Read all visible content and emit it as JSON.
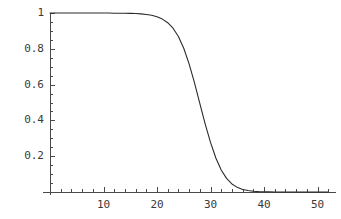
{
  "chart_data": {
    "type": "line",
    "title": "",
    "subtitle": "",
    "xlabel": "",
    "ylabel": "",
    "xlim": [
      0,
      52
    ],
    "ylim": [
      0,
      1.02
    ],
    "grid": false,
    "legend": null,
    "axis_color": "#4a4a4a",
    "line_color": "#2b2b2b",
    "background": "#ffffff",
    "x_ticks": [
      {
        "value": 10,
        "label": "10"
      },
      {
        "value": 20,
        "label": "20"
      },
      {
        "value": 30,
        "label": "30"
      },
      {
        "value": 40,
        "label": "40"
      },
      {
        "value": 50,
        "label": "50"
      }
    ],
    "y_ticks": [
      {
        "value": 0.2,
        "label": "0.2"
      },
      {
        "value": 0.4,
        "label": "0.4"
      },
      {
        "value": 0.6,
        "label": "0.6"
      },
      {
        "value": 0.8,
        "label": "0.8"
      },
      {
        "value": 1.0,
        "label": "1"
      }
    ],
    "x_minor_tick_step": 2,
    "y_minor_tick_step": 0.05,
    "series": [
      {
        "name": "curve",
        "x": [
          0,
          1,
          2,
          3,
          4,
          5,
          6,
          7,
          8,
          9,
          10,
          11,
          12,
          13,
          14,
          15,
          16,
          17,
          18,
          19,
          20,
          21,
          22,
          23,
          24,
          25,
          26,
          27,
          28,
          29,
          30,
          31,
          32,
          33,
          34,
          35,
          36,
          37,
          38,
          39,
          40,
          41,
          42,
          43,
          44,
          45,
          46,
          47,
          48,
          49,
          50,
          51,
          52
        ],
        "y": [
          1.0,
          1.0,
          1.0,
          1.0,
          1.0,
          1.0,
          1.0,
          1.0,
          1.0,
          1.0,
          1.0,
          1.0,
          0.999,
          0.999,
          0.999,
          0.998,
          0.997,
          0.995,
          0.992,
          0.987,
          0.979,
          0.966,
          0.946,
          0.915,
          0.869,
          0.803,
          0.716,
          0.611,
          0.495,
          0.381,
          0.277,
          0.19,
          0.123,
          0.076,
          0.045,
          0.026,
          0.014,
          0.008,
          0.004,
          0.002,
          0.001,
          0.001,
          0.0,
          0.0,
          0.0,
          0.0,
          0.0,
          0.0,
          0.0,
          0.0,
          0.0,
          0.0,
          0.0
        ]
      }
    ]
  },
  "plot_geometry": {
    "origin_x_px": 50,
    "origin_y_px": 192,
    "x_unit_px": 5.35,
    "y_top_px": 13,
    "y_one_px": 13
  }
}
